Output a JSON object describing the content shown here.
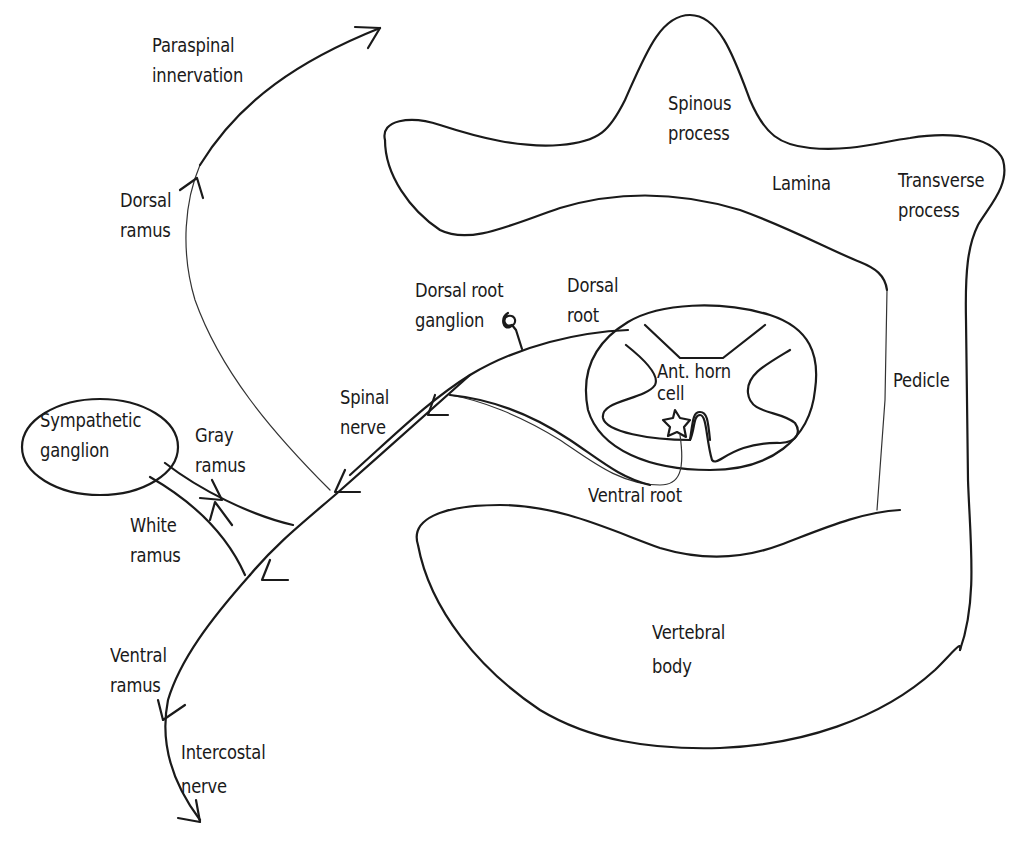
{
  "diagram": {
    "stroke_color": "#1a1a1a",
    "background": "#ffffff",
    "labels": {
      "paraspinal_innervation": [
        "Paraspinal",
        "innervation"
      ],
      "dorsal_ramus": [
        "Dorsal",
        "ramus"
      ],
      "spinous_process": [
        "Spinous",
        "process"
      ],
      "lamina": "Lamina",
      "transverse_process": [
        "Transverse",
        "process"
      ],
      "dorsal_root_ganglion": [
        "Dorsal root",
        "ganglion"
      ],
      "dorsal_root": [
        "Dorsal",
        "root"
      ],
      "ant_horn_cell": [
        "Ant. horn",
        "cell"
      ],
      "pedicle": "Pedicle",
      "spinal_nerve": [
        "Spinal",
        "nerve"
      ],
      "sympathetic_ganglion": [
        "Sympathetic",
        "ganglion"
      ],
      "gray_ramus": [
        "Gray",
        "ramus"
      ],
      "white_ramus": [
        "White",
        "ramus"
      ],
      "ventral_root": "Ventral root",
      "vertebral_body": [
        "Vertebral",
        "body"
      ],
      "ventral_ramus": [
        "Ventral",
        "ramus"
      ],
      "intercostal_nerve": [
        "Intercostal",
        "nerve"
      ]
    },
    "icons": {
      "dorsal_root_ganglion": "spiral-icon",
      "ant_horn_cell": "star-icon",
      "arrowheads": "arrowhead-icon"
    }
  }
}
